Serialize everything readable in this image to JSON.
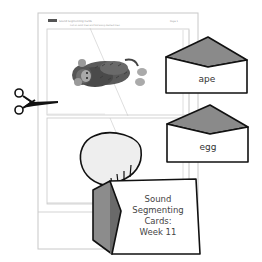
{
  "worksheet": {
    "header_label": "Week 11",
    "header_title": "Sound Segmenting Cards",
    "header_subtitle": "Cut on solid lines and fold along dashed lines",
    "page_number": "Page 1",
    "picture": "monkey (ape)"
  },
  "cards": [
    {
      "word": "ape"
    },
    {
      "word": "egg"
    }
  ],
  "cover": {
    "line1": "Sound",
    "line2": "Segmenting",
    "line3": "Cards:",
    "line4": "Week 11"
  },
  "icons": {
    "scissors": "scissors-icon",
    "envelope": "envelope-icon",
    "bag": "bag-icon"
  },
  "colors": {
    "envelope_flap": "#8a8a8a",
    "envelope_flap_dark": "#6d6d6d",
    "bag_side": "#8c8c8c",
    "bag_side_dark": "#6a6a6a",
    "bag_top": "#eeeeee",
    "outline": "#111111",
    "page_border": "#c8c8c8"
  }
}
